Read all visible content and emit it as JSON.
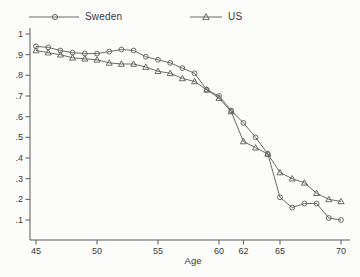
{
  "chart_data": {
    "type": "line",
    "title": "",
    "xlabel": "Age",
    "ylabel": "",
    "xlim": [
      44.5,
      70.7
    ],
    "ylim": [
      0,
      1.03
    ],
    "grid": false,
    "legend_position": "top",
    "line_color": "#5a5a5a",
    "text_color": "#3a3a3a",
    "marker_fill": "none",
    "x": [
      45,
      46,
      47,
      48,
      49,
      50,
      51,
      52,
      53,
      54,
      55,
      56,
      57,
      58,
      59,
      60,
      61,
      62,
      63,
      64,
      65,
      66,
      67,
      68,
      69,
      70
    ],
    "series": [
      {
        "name": "Sweden",
        "marker": "circle",
        "icon": "circle-marker",
        "values": [
          0.94,
          0.935,
          0.92,
          0.91,
          0.905,
          0.905,
          0.915,
          0.925,
          0.92,
          0.89,
          0.875,
          0.86,
          0.835,
          0.81,
          0.73,
          0.7,
          0.63,
          0.57,
          0.5,
          0.42,
          0.21,
          0.16,
          0.18,
          0.18,
          0.11,
          0.1
        ]
      },
      {
        "name": "US",
        "marker": "triangle",
        "icon": "triangle-marker",
        "values": [
          0.92,
          0.91,
          0.9,
          0.885,
          0.88,
          0.875,
          0.86,
          0.855,
          0.855,
          0.84,
          0.82,
          0.81,
          0.785,
          0.77,
          0.73,
          0.69,
          0.625,
          0.48,
          0.45,
          0.42,
          0.33,
          0.3,
          0.28,
          0.23,
          0.2,
          0.19
        ]
      }
    ],
    "x_ticks": [
      {
        "value": 45,
        "label": "45"
      },
      {
        "value": 50,
        "label": "50"
      },
      {
        "value": 55,
        "label": "55"
      },
      {
        "value": 60,
        "label": "60"
      },
      {
        "value": 62,
        "label": "62"
      },
      {
        "value": 65,
        "label": "65"
      },
      {
        "value": 70,
        "label": "70"
      }
    ],
    "y_ticks": [
      {
        "value": 1.0,
        "label": "1"
      },
      {
        "value": 0.9,
        "label": ".9"
      },
      {
        "value": 0.8,
        "label": ".8"
      },
      {
        "value": 0.7,
        "label": ".7"
      },
      {
        "value": 0.6,
        "label": ".6"
      },
      {
        "value": 0.5,
        "label": ".5"
      },
      {
        "value": 0.4,
        "label": ".4"
      },
      {
        "value": 0.3,
        "label": ".3"
      },
      {
        "value": 0.2,
        "label": ".2"
      },
      {
        "value": 0.1,
        "label": ".1"
      }
    ]
  }
}
